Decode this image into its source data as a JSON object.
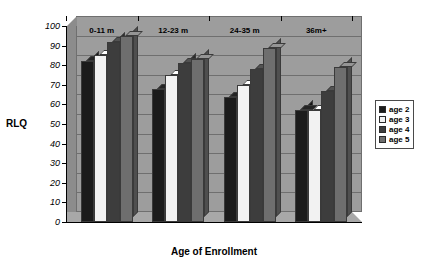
{
  "chart_data": {
    "type": "bar",
    "title": "",
    "xlabel": "Age of Enrollment",
    "ylabel": "RLQ",
    "categories": [
      "0-11 m",
      "12-23 m",
      "24-35 m",
      "36m+"
    ],
    "series": [
      {
        "name": "age 2",
        "color": "#1b1b1b",
        "values": [
          82,
          68,
          64,
          57
        ]
      },
      {
        "name": "age 3",
        "color": "#f2f2f2",
        "values": [
          85,
          75,
          70,
          57
        ]
      },
      {
        "name": "age 4",
        "color": "#3d3d3d",
        "values": [
          92,
          81,
          78,
          67
        ]
      },
      {
        "name": "age 5",
        "color": "#6e6e6e",
        "values": [
          95,
          83,
          89,
          79
        ]
      }
    ],
    "ylim": [
      0,
      100
    ],
    "ytick_step": 10,
    "yticks": [
      0,
      10,
      20,
      30,
      40,
      50,
      60,
      70,
      80,
      90,
      100
    ],
    "grid": true,
    "legend_position": "right",
    "plot_background": "#9d9d9d"
  },
  "legend": {
    "items": [
      {
        "label": "age 2",
        "color": "#1b1b1b"
      },
      {
        "label": "age 3",
        "color": "#f2f2f2"
      },
      {
        "label": "age 4",
        "color": "#3d3d3d"
      },
      {
        "label": "age 5",
        "color": "#6e6e6e"
      }
    ]
  }
}
